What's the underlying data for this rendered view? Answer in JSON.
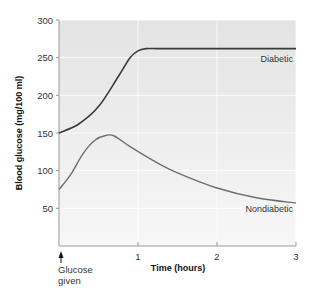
{
  "chart_data": {
    "type": "line",
    "title": "",
    "xlabel": "Time (hours)",
    "ylabel": "Blood glucose (mg/100 ml)",
    "xlim": [
      0,
      3
    ],
    "ylim": [
      0,
      300
    ],
    "x_ticks": [
      "1",
      "2",
      "3"
    ],
    "y_ticks": [
      "50",
      "100",
      "150",
      "200",
      "250",
      "300"
    ],
    "grid": true,
    "annotation": {
      "text_line1": "Glucose",
      "text_line2": "given",
      "x": 0
    },
    "series": [
      {
        "name": "Diabetic",
        "color": "#3a3a3a",
        "x": [
          0,
          0.25,
          0.5,
          0.75,
          0.9,
          1.0,
          1.1,
          1.25,
          1.5,
          2.0,
          2.5,
          3.0
        ],
        "values": [
          150,
          162,
          185,
          225,
          250,
          259,
          262,
          262,
          262,
          262,
          262,
          262
        ]
      },
      {
        "name": "Nondiabetic",
        "color": "#6e6e6e",
        "x": [
          0,
          0.15,
          0.3,
          0.45,
          0.6,
          0.7,
          0.9,
          1.2,
          1.5,
          2.0,
          2.5,
          3.0
        ],
        "values": [
          75,
          95,
          122,
          140,
          147,
          146,
          132,
          113,
          97,
          77,
          64,
          57
        ]
      }
    ]
  }
}
